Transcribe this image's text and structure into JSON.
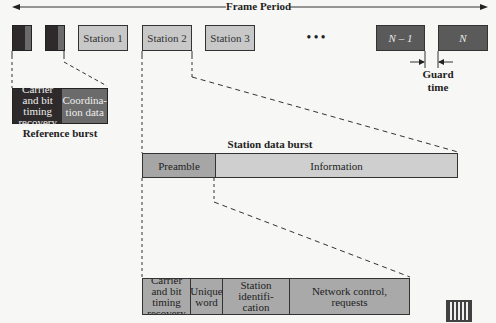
{
  "title": "Frame Period",
  "frame": {
    "stations": [
      {
        "label": "Station 1"
      },
      {
        "label": "Station 2"
      },
      {
        "label": "Station 3"
      }
    ],
    "ellipsis": "• • •",
    "last_stations": [
      {
        "label": "N – 1"
      },
      {
        "label": "N"
      }
    ],
    "guard_time_label": "Guard time"
  },
  "reference_burst": {
    "title": "Reference burst",
    "fields": [
      {
        "label": "Carrier and bit timing recovery",
        "color": "#2e2a2b"
      },
      {
        "label": "Coordina-tion data",
        "color": "#6b6b6b"
      }
    ]
  },
  "station_data_burst": {
    "title": "Station data burst",
    "fields": [
      {
        "label": "Preamble",
        "color": "#a6a6a6"
      },
      {
        "label": "Information",
        "color": "#cfcfcf"
      }
    ]
  },
  "preamble_detail": {
    "fields": [
      {
        "label": "Carrier and bit timing recovery"
      },
      {
        "label": "Unique word"
      },
      {
        "label": "Station identifi-cation"
      },
      {
        "label": "Network control, requests"
      }
    ],
    "color": "#a9a9a9"
  }
}
